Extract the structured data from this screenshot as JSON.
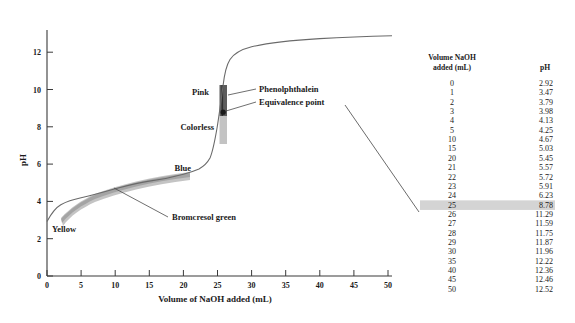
{
  "figure": {
    "title": "",
    "background_color": "#ffffff"
  },
  "chart_data": {
    "type": "line",
    "title": "",
    "xlabel": "Volume of NaOH added  (mL)",
    "ylabel": "pH",
    "xlim": [
      0,
      50
    ],
    "ylim": [
      0,
      13.2
    ],
    "xticks": [
      "0",
      "5",
      "10",
      "15",
      "20",
      "25",
      "30",
      "35",
      "40",
      "45",
      "50"
    ],
    "xtick_values": [
      0,
      5,
      10,
      15,
      20,
      25,
      30,
      35,
      40,
      45,
      50
    ],
    "yticks": [
      "0",
      "2",
      "4",
      "6",
      "8",
      "10",
      "12"
    ],
    "ytick_values": [
      0,
      2,
      4,
      6,
      8,
      10,
      12
    ],
    "grid": false,
    "legend": "none",
    "x": [
      0,
      1,
      2,
      3,
      4,
      5,
      10,
      15,
      20,
      21,
      22,
      23,
      24,
      25,
      26,
      27,
      28,
      29,
      30,
      35,
      40,
      45,
      50
    ],
    "y": [
      2.92,
      3.47,
      3.79,
      3.98,
      4.13,
      4.25,
      4.67,
      5.03,
      5.45,
      5.57,
      5.72,
      5.91,
      6.23,
      8.78,
      11.29,
      11.59,
      11.75,
      11.87,
      11.96,
      12.22,
      12.36,
      12.46,
      12.52
    ],
    "series": [
      {
        "name": "Titration curve: weak acid with NaOH",
        "values": [
          2.92,
          3.47,
          3.79,
          3.98,
          4.13,
          4.25,
          4.67,
          5.03,
          5.45,
          5.57,
          5.72,
          5.91,
          6.23,
          8.78,
          11.29,
          11.59,
          11.75,
          11.87,
          11.96,
          12.22,
          12.36,
          12.46,
          12.52
        ]
      }
    ],
    "annotations": [
      {
        "text": "Pink",
        "x": 22.0,
        "y": 10.1
      },
      {
        "text": "Colorless",
        "x": 18.6,
        "y": 8.0
      },
      {
        "text": "Blue",
        "x": 19.5,
        "y": 6.1
      },
      {
        "text": "Yellow",
        "x": 2.5,
        "y": 3.3
      },
      {
        "text": "Phenolphthalein",
        "x": 31.0,
        "y": 10.1
      },
      {
        "text": "Equivalence point",
        "x": 31.0,
        "y": 9.0
      },
      {
        "text": "Bromcresol green",
        "x": 22.0,
        "y": 3.5
      }
    ],
    "indicator_bands": [
      {
        "name": "phenolphthalein",
        "ph_range": [
          8.0,
          10.0
        ],
        "color_low": "Colorless",
        "color_high": "Pink",
        "shade": "#5a5a5a"
      },
      {
        "name": "bromcresol-green",
        "ph_range": [
          3.8,
          5.4
        ],
        "color_low": "Yellow",
        "color_high": "Blue",
        "shade": "#9b9b9b"
      }
    ],
    "equivalence_point": {
      "volume_mL": 25,
      "pH": 8.78
    }
  },
  "table": {
    "header": {
      "volume": "Volume NaOH",
      "volume_sub": "added (mL)",
      "ph": "pH"
    },
    "highlight_row_index": 13,
    "highlight_color": "#d4d4d4",
    "rows": [
      {
        "volume": "0",
        "ph": "2.92"
      },
      {
        "volume": "1",
        "ph": "3.47"
      },
      {
        "volume": "2",
        "ph": "3.79"
      },
      {
        "volume": "3",
        "ph": "3.98"
      },
      {
        "volume": "4",
        "ph": "4.13"
      },
      {
        "volume": "5",
        "ph": "4.25"
      },
      {
        "volume": "10",
        "ph": "4.67"
      },
      {
        "volume": "15",
        "ph": "5.03"
      },
      {
        "volume": "20",
        "ph": "5.45"
      },
      {
        "volume": "21",
        "ph": "5.57"
      },
      {
        "volume": "22",
        "ph": "5.72"
      },
      {
        "volume": "23",
        "ph": "5.91"
      },
      {
        "volume": "24",
        "ph": "6.23"
      },
      {
        "volume": "25",
        "ph": "8.78"
      },
      {
        "volume": "26",
        "ph": "11.29"
      },
      {
        "volume": "27",
        "ph": "11.59"
      },
      {
        "volume": "28",
        "ph": "11.75"
      },
      {
        "volume": "29",
        "ph": "11.87"
      },
      {
        "volume": "30",
        "ph": "11.96"
      },
      {
        "volume": "35",
        "ph": "12.22"
      },
      {
        "volume": "40",
        "ph": "12.36"
      },
      {
        "volume": "45",
        "ph": "12.46"
      },
      {
        "volume": "50",
        "ph": "12.52"
      }
    ]
  }
}
